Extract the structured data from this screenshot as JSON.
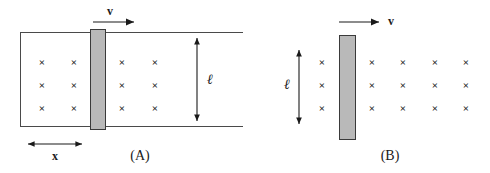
{
  "figure": {
    "width": 490,
    "height": 173,
    "background": "#ffffff",
    "line_color": "#4a4a4a",
    "bar_fill": "#b9b9b9",
    "bar_stroke": "#3a3a3a",
    "text_color": "#1a1a1a"
  },
  "panel_a": {
    "caption": "(A)",
    "velocity_label": "v",
    "length_label": "ℓ",
    "distance_label": "x",
    "field_symbol": "×",
    "field_grid": {
      "rows": 3,
      "columns": 4,
      "columns_left_of_bar": 2,
      "columns_right_of_bar": 2,
      "marks": [
        "×",
        "×",
        "×",
        "×",
        "×",
        "×",
        "×",
        "×",
        "×",
        "×",
        "×",
        "×"
      ]
    }
  },
  "panel_b": {
    "caption": "(B)",
    "velocity_label": "v",
    "length_label": "ℓ",
    "field_symbol": "×",
    "field_grid": {
      "rows": 3,
      "columns": 5,
      "columns_left_of_bar": 1,
      "columns_right_of_bar": 4,
      "marks": [
        "×",
        "×",
        "×",
        "×",
        "×",
        "×",
        "×",
        "×",
        "×",
        "×",
        "×",
        "×",
        "×",
        "×",
        "×"
      ]
    }
  }
}
